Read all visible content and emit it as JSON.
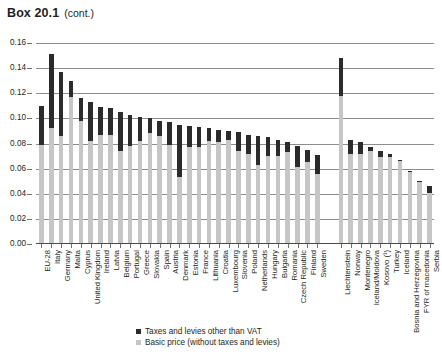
{
  "title": {
    "main": "Box 20.1",
    "sub": "(cont.)"
  },
  "legend": {
    "items": [
      {
        "label": "Taxes and levies other than VAT",
        "color": "#2b2b2b",
        "swatch": "dark-swatch"
      },
      {
        "label": "Basic price (without taxes and levies)",
        "color": "#c6c6c6",
        "swatch": "light-swatch"
      }
    ]
  },
  "colors": {
    "taxes": "#2b2b2b",
    "basic_price": "#c6c6c6",
    "gridline": "#8d8d8d",
    "text": "#231f20"
  },
  "chart_data": {
    "type": "bar",
    "stacked": true,
    "title": "Box 20.1 (cont.)",
    "xlabel": "",
    "ylabel": "",
    "ylim": [
      0.0,
      0.16
    ],
    "ytick_labels": [
      "0.16",
      "0.14",
      "0.12",
      "0.10",
      "0.08",
      "0.06",
      "0.04",
      "0.02",
      "0.00"
    ],
    "ytick_values": [
      0.16,
      0.14,
      0.12,
      0.1,
      0.08,
      0.06,
      0.04,
      0.02,
      0.0
    ],
    "grid": true,
    "legend_position": "bottom-center",
    "categories": [
      "EU-28",
      "Italy",
      "Germany",
      "Malta",
      "Cyprus",
      "United Kingdom",
      "Ireland",
      "Latvia",
      "Belgium",
      "Portugal",
      "Greece",
      "Slovakia",
      "Spain",
      "Austria",
      "Denmark",
      "Estonia",
      "France",
      "Lithuania",
      "Croatia",
      "Luxembourg",
      "Slovenia",
      "Poland",
      "Netherlands",
      "Hungary",
      "Bulgaria",
      "Romania",
      "Czech Republic",
      "Finland",
      "Sweden",
      "Liechtenstein",
      "Norway",
      "Montenegro",
      "Iceland/Moldova",
      "Kosovo (¹)",
      "Turkey",
      "Iceland",
      "Bosnia and Herzegovina",
      "FYR of macedonia",
      "Serbia"
    ],
    "group_gap_after_index": 28,
    "series": [
      {
        "name": "Basic price (without taxes and levies)",
        "color": "#c6c6c6",
        "values": [
          0.079,
          0.092,
          0.086,
          0.117,
          0.098,
          0.082,
          0.087,
          0.087,
          0.074,
          0.078,
          0.082,
          0.088,
          0.086,
          0.079,
          0.053,
          0.077,
          0.077,
          0.082,
          0.081,
          0.083,
          0.074,
          0.072,
          0.063,
          0.07,
          0.07,
          0.073,
          0.061,
          0.065,
          0.056,
          0.118,
          0.072,
          0.072,
          0.074,
          0.069,
          0.069,
          0.066,
          0.057,
          0.049,
          0.041
        ]
      },
      {
        "name": "Taxes and levies other than VAT",
        "color": "#2b2b2b",
        "values": [
          0.031,
          0.059,
          0.051,
          0.013,
          0.018,
          0.031,
          0.022,
          0.021,
          0.031,
          0.025,
          0.019,
          0.012,
          0.012,
          0.018,
          0.042,
          0.017,
          0.016,
          0.01,
          0.01,
          0.007,
          0.015,
          0.015,
          0.023,
          0.015,
          0.013,
          0.008,
          0.017,
          0.01,
          0.015,
          0.03,
          0.011,
          0.009,
          0.003,
          0.005,
          0.003,
          0.001,
          0.001,
          0.001,
          0.005
        ]
      }
    ],
    "totals": [
      0.11,
      0.151,
      0.137,
      0.13,
      0.116,
      0.113,
      0.109,
      0.108,
      0.105,
      0.103,
      0.101,
      0.1,
      0.098,
      0.097,
      0.095,
      0.094,
      0.093,
      0.092,
      0.091,
      0.09,
      0.089,
      0.087,
      0.086,
      0.085,
      0.083,
      0.081,
      0.078,
      0.075,
      0.071,
      0.148,
      0.083,
      0.081,
      0.077,
      0.074,
      0.072,
      0.067,
      0.058,
      0.05,
      0.046
    ]
  }
}
